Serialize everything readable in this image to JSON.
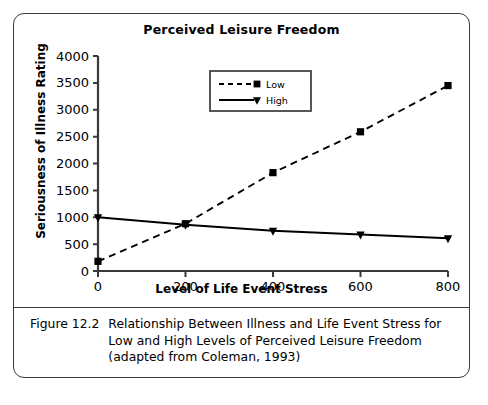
{
  "figure": {
    "caption_number": "Figure 12.2",
    "caption_text": "Relationship Between Illness and Life Event Stress for Low and High Levels of Perceived Leisure Freedom (adapted from Coleman, 1993)"
  },
  "chart_data": {
    "type": "line",
    "title": "Perceived Leisure Freedom",
    "xlabel": "Level of Life Event Stress",
    "ylabel": "Seriousness of Illness Rating",
    "x": [
      0,
      200,
      400,
      600,
      800
    ],
    "xlim": [
      0,
      800
    ],
    "ylim": [
      0,
      4000
    ],
    "xticks": [
      "0",
      "200",
      "400",
      "600",
      "800"
    ],
    "yticks": [
      "0",
      "500",
      "1000",
      "1500",
      "2000",
      "2500",
      "3000",
      "3500",
      "4000"
    ],
    "grid": false,
    "legend_position": "top-center",
    "series": [
      {
        "name": "Low",
        "values": [
          180,
          880,
          1830,
          2590,
          3450
        ],
        "style": "dashed",
        "marker": "square",
        "color": "#000000"
      },
      {
        "name": "High",
        "values": [
          1000,
          860,
          750,
          680,
          610
        ],
        "style": "solid",
        "marker": "triangle-down",
        "color": "#000000"
      }
    ]
  }
}
